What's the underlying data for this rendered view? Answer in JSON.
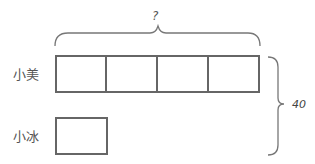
{
  "diagram": {
    "type": "tape-diagram",
    "unknown_label": "?",
    "total_label": "40",
    "rows": [
      {
        "name": "小美",
        "units": 4
      },
      {
        "name": "小冰",
        "units": 1
      }
    ],
    "colors": {
      "stroke": "#666666",
      "text": "#555555",
      "brace": "#777777"
    }
  }
}
